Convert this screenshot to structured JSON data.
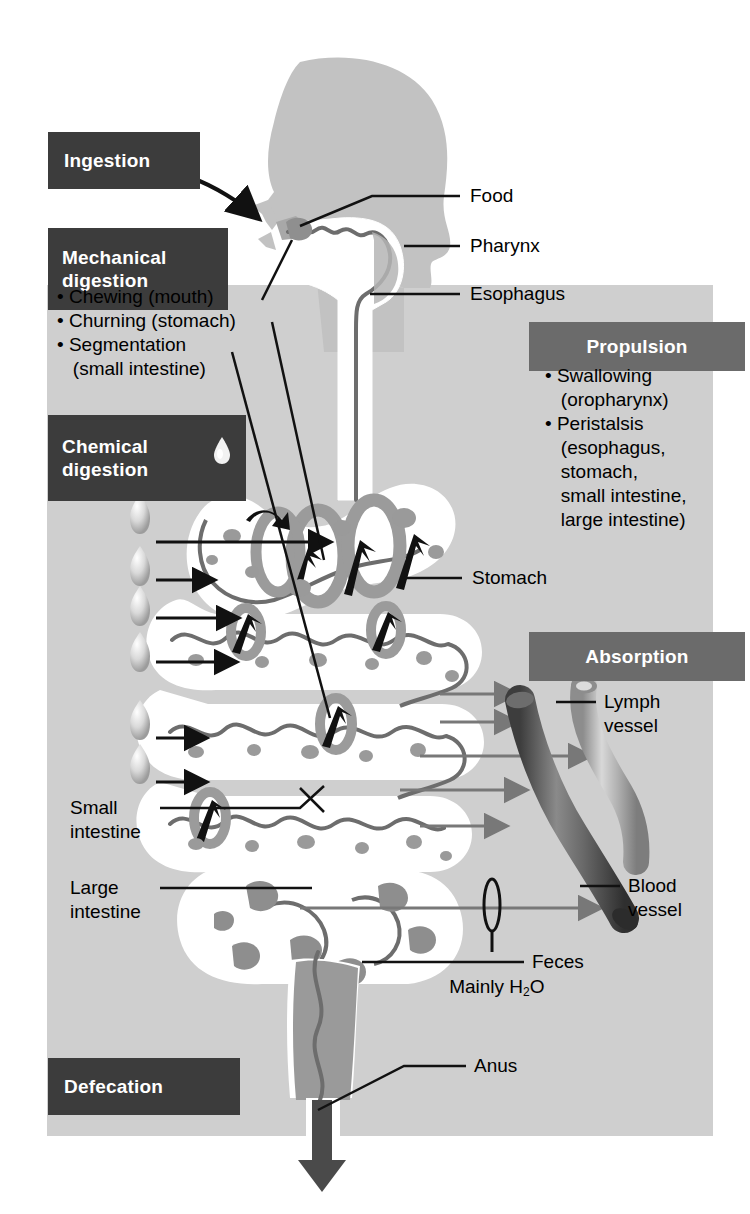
{
  "diagram": {
    "colors": {
      "panel_gray": "#cfcfcf",
      "caption_dark": "#3c3c3c",
      "caption_mid": "#6b6b6b",
      "tract_white": "#ffffff",
      "tissue_gray": "#a8a8a8",
      "chyme_gray": "#9a9a9a",
      "blood_vessel": "#5a5a5a",
      "lymph_vessel": "#9e9e9e",
      "arrow_gray": "#787878",
      "head_silhouette": "#c2c2c2"
    }
  },
  "captions": {
    "ingestion": "Ingestion",
    "mechanical_digestion_line1": "Mechanical",
    "mechanical_digestion_line2": "digestion",
    "chemical_digestion_line1": "Chemical",
    "chemical_digestion_line2": "digestion",
    "propulsion": "Propulsion",
    "absorption": "Absorption",
    "defecation": "Defecation"
  },
  "mechanical_list": [
    "• Chewing (mouth)",
    "• Churning (stomach)",
    "• Segmentation",
    "   (small intestine)"
  ],
  "propulsion_list": [
    "• Swallowing",
    "   (oropharynx)",
    "• Peristalsis",
    "   (esophagus,",
    "   stomach,",
    "   small intestine,",
    "   large intestine)"
  ],
  "labels": {
    "food": "Food",
    "pharynx": "Pharynx",
    "esophagus": "Esophagus",
    "stomach": "Stomach",
    "lymph_vessel_line1": "Lymph",
    "lymph_vessel_line2": "vessel",
    "blood_vessel_line1": "Blood",
    "blood_vessel_line2": "vessel",
    "small_intestine_line1": "Small",
    "small_intestine_line2": "intestine",
    "large_intestine_line1": "Large",
    "large_intestine_line2": "intestine",
    "mainly_water_pre": "Mainly H",
    "mainly_water_sub": "2",
    "mainly_water_post": "O",
    "feces": "Feces",
    "anus": "Anus"
  },
  "icons": {
    "chemical_droplet": "droplet-icon",
    "enzyme_droplets_count": 6,
    "ingestion_arrow": "curved-arrow-icon",
    "defecation_arrow": "down-arrow-icon"
  }
}
